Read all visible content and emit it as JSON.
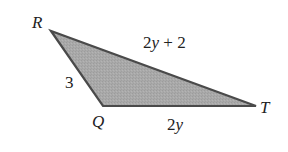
{
  "figure": {
    "type": "triangle",
    "fill_color": "#a9a9a9",
    "stroke_color": "#4a4a4a",
    "vertices": [
      {
        "name": "R",
        "label": "R"
      },
      {
        "name": "Q",
        "label": "Q"
      },
      {
        "name": "T",
        "label": "T"
      }
    ],
    "sides": {
      "RQ": "3",
      "RT": "2y + 2",
      "QT": "2y"
    }
  }
}
